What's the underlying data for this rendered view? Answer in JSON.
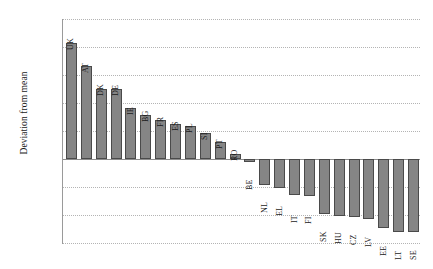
{
  "chart_data": {
    "type": "bar",
    "title": "",
    "xlabel": "",
    "ylabel": "Deviation from mean",
    "ylim": [
      -1.5,
      2.5
    ],
    "ytick_labels": [
      "2.50",
      "2.00",
      "1.50",
      "1.00",
      "0.50",
      "0.00",
      "−0.50",
      "−1.00",
      "−1.50"
    ],
    "ytick_values": [
      2.5,
      2.0,
      1.5,
      1.0,
      0.5,
      0.0,
      -0.5,
      -1.0,
      -1.5
    ],
    "grid": true,
    "legend": "none",
    "bar_color": "#858585",
    "bar_edge_color": "#4a4a4a",
    "categories": [
      "UK",
      "AT",
      "DK",
      "DE",
      "IE",
      "BG",
      "FR",
      "ES",
      "PL",
      "SI",
      "PT",
      "RO",
      "BE",
      "NL",
      "EL",
      "IT",
      "FI",
      "SK",
      "HU",
      "CZ",
      "LV",
      "EE",
      "LT",
      "SE"
    ],
    "values": [
      2.07,
      1.66,
      1.25,
      1.25,
      0.91,
      0.79,
      0.7,
      0.63,
      0.59,
      0.46,
      0.3,
      0.09,
      -0.05,
      -0.47,
      -0.52,
      -0.64,
      -0.66,
      -0.98,
      -1.02,
      -1.04,
      -1.07,
      -1.23,
      -1.3,
      -1.31
    ]
  }
}
